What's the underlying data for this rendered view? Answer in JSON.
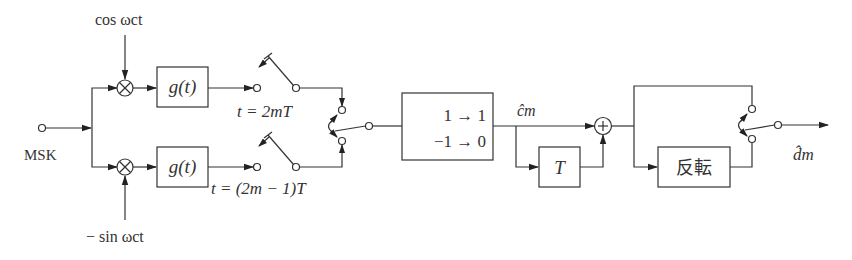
{
  "diagram": {
    "input_label": "MSK",
    "carriers": {
      "cos_label": "cos ωct",
      "sin_label": "− sin ωct"
    },
    "filters": {
      "upper_label": "g(t)",
      "lower_label": "g(t)"
    },
    "sampling": {
      "upper_label": "t = 2mT",
      "lower_label": "t = (2m − 1)T"
    },
    "mapping_box": {
      "line1": "1 → 1",
      "line2": "−1 → 0"
    },
    "c_hat_label": "ĉm",
    "delay_box_label": "T",
    "adder_symbol": "+",
    "multiplier_symbol": "×",
    "invert_box_label": "反転",
    "output_label": "d̂m"
  }
}
